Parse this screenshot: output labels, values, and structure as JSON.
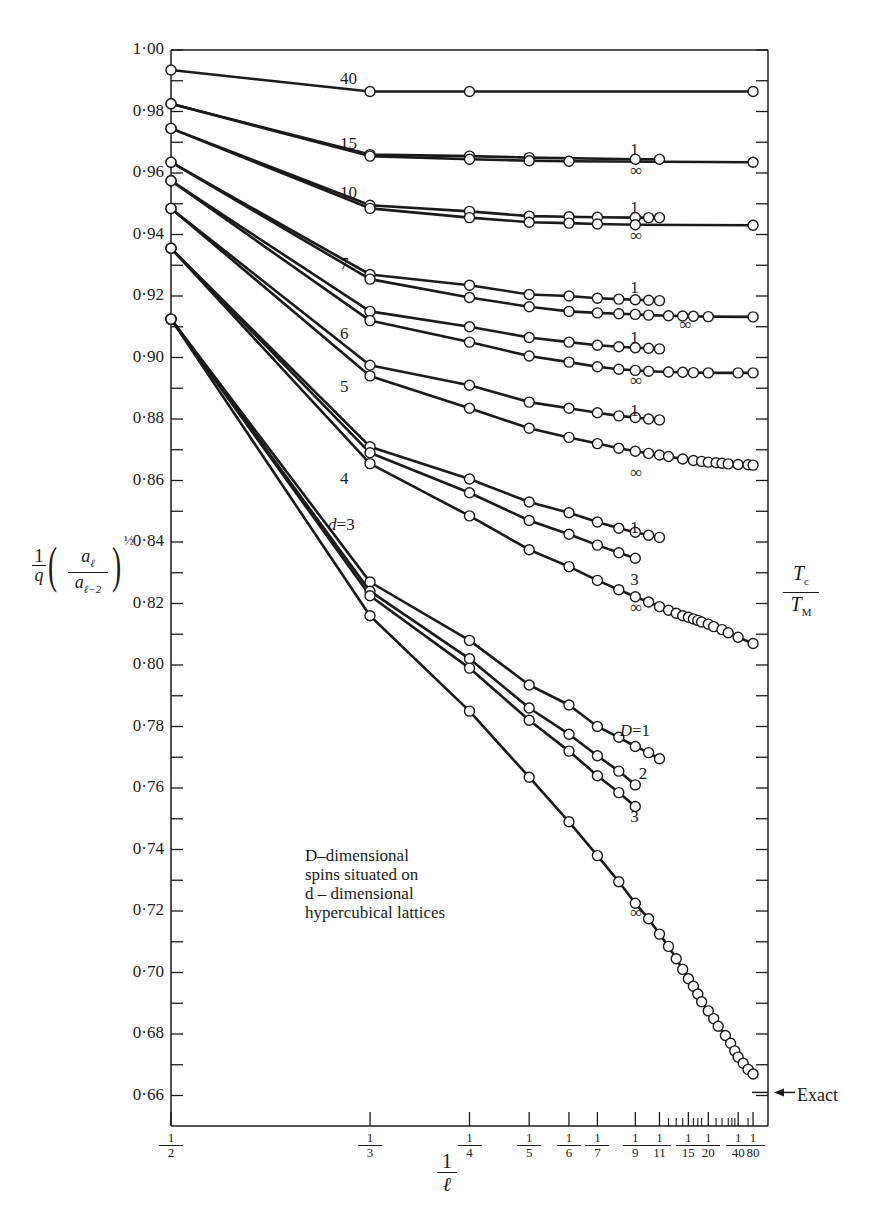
{
  "chart_data": {
    "type": "line",
    "title": "",
    "xlabel": "1/ℓ",
    "ylabel": "(1/q)(a_ℓ / a_{ℓ-2})^{1/2}",
    "right_label": "Tc / TM",
    "annotation": [
      "D-dimensional",
      "spins situated on",
      "d-dimensional",
      "hypercubical lattices"
    ],
    "exact_marker": {
      "label": "Exact",
      "y": 0.661
    },
    "ylim": [
      0.65,
      1.0
    ],
    "xlim": [
      0,
      0.5
    ],
    "x_scale": "linear in 1/ℓ (reversed: 1/2 at left, 0 at right)",
    "y_ticks": [
      "1·00",
      "0·98",
      "0·96",
      "0·94",
      "0·92",
      "0·90",
      "0·88",
      "0·86",
      "0·84",
      "0·82",
      "0·80",
      "0·78",
      "0·76",
      "0·74",
      "0·72",
      "0·70",
      "0·68",
      "0·66"
    ],
    "x_ticks": [
      {
        "num": "1",
        "den": "2",
        "value": 0.5
      },
      {
        "num": "1",
        "den": "3",
        "value": 0.3333
      },
      {
        "num": "1",
        "den": "4",
        "value": 0.25
      },
      {
        "num": "1",
        "den": "5",
        "value": 0.2
      },
      {
        "num": "1",
        "den": "6",
        "value": 0.1667
      },
      {
        "num": "1",
        "den": "7",
        "value": 0.1429
      },
      {
        "num": "1",
        "den": "9",
        "value": 0.1111
      },
      {
        "num": "1",
        "den": "11",
        "value": 0.0909
      },
      {
        "num": "1",
        "den": "15",
        "value": 0.0667
      },
      {
        "num": "1",
        "den": "20",
        "value": 0.05
      },
      {
        "num": "1",
        "den": "40",
        "value": 0.025
      },
      {
        "num": "1",
        "den": "80",
        "value": 0.0125
      }
    ],
    "minor_x_ticks": [
      0.0833,
      0.0769,
      0.0714,
      0.0625,
      0.0588,
      0.0556,
      0.0435,
      0.0385,
      0.0333,
      0.0303,
      0.0278,
      0.0167
    ],
    "group_labels": [
      {
        "text": "40",
        "x": 0.335,
        "y": 0.9905
      },
      {
        "text": "15",
        "x": 0.335,
        "y": 0.9695
      },
      {
        "text": "10",
        "x": 0.335,
        "y": 0.9535
      },
      {
        "text": "7",
        "x": 0.335,
        "y": 0.9305
      },
      {
        "text": "6",
        "x": 0.335,
        "y": 0.9075
      },
      {
        "text": "5",
        "x": 0.335,
        "y": 0.8905
      },
      {
        "text": "4",
        "x": 0.335,
        "y": 0.8605
      },
      {
        "text": "d=3",
        "x": 0.345,
        "y": 0.8455
      }
    ],
    "series_labels": [
      {
        "text": "1",
        "x": 0.1111,
        "y": 0.9675
      },
      {
        "text": "∞",
        "x": 0.1111,
        "y": 0.9605
      },
      {
        "text": "1",
        "x": 0.1111,
        "y": 0.9485
      },
      {
        "text": "∞",
        "x": 0.1111,
        "y": 0.9395
      },
      {
        "text": "1",
        "x": 0.1111,
        "y": 0.9225
      },
      {
        "text": "∞",
        "x": 0.07,
        "y": 0.9105
      },
      {
        "text": "1",
        "x": 0.1111,
        "y": 0.9065
      },
      {
        "text": "∞",
        "x": 0.1111,
        "y": 0.8925
      },
      {
        "text": "1",
        "x": 0.1111,
        "y": 0.8825
      },
      {
        "text": "∞",
        "x": 0.1111,
        "y": 0.8625
      },
      {
        "text": "1",
        "x": 0.1111,
        "y": 0.8445
      },
      {
        "text": "3",
        "x": 0.1111,
        "y": 0.8275
      },
      {
        "text": "∞",
        "x": 0.1111,
        "y": 0.8185
      },
      {
        "text": "D=1",
        "x": 0.12,
        "y": 0.7785
      },
      {
        "text": "2",
        "x": 0.104,
        "y": 0.7645
      },
      {
        "text": "3",
        "x": 0.1111,
        "y": 0.7505
      },
      {
        "text": "∞",
        "x": 0.1111,
        "y": 0.7195
      }
    ],
    "series": [
      {
        "name": "d=40, D=1",
        "x": [
          0.5,
          0.3333,
          0.25,
          0.0125
        ],
        "y": [
          0.9935,
          0.9865,
          0.9865,
          0.9865
        ]
      },
      {
        "name": "d=15, D=1",
        "x": [
          0.5,
          0.3333,
          0.25,
          0.2,
          0.1111,
          0.0909
        ],
        "y": [
          0.9825,
          0.966,
          0.9655,
          0.965,
          0.9645,
          0.9645
        ]
      },
      {
        "name": "d=15, D=∞",
        "x": [
          0.5,
          0.3333,
          0.25,
          0.2,
          0.1667,
          0.0125
        ],
        "y": [
          0.9825,
          0.9655,
          0.9645,
          0.964,
          0.9638,
          0.9635
        ]
      },
      {
        "name": "d=10, D=1",
        "x": [
          0.5,
          0.3333,
          0.25,
          0.2,
          0.1667,
          0.1429,
          0.1111,
          0.1,
          0.0909
        ],
        "y": [
          0.9745,
          0.9495,
          0.9475,
          0.946,
          0.9458,
          0.9456,
          0.9455,
          0.9455,
          0.9455
        ]
      },
      {
        "name": "d=10, D=∞",
        "x": [
          0.5,
          0.3333,
          0.25,
          0.2,
          0.1667,
          0.1429,
          0.1111,
          0.0125
        ],
        "y": [
          0.9745,
          0.9485,
          0.9455,
          0.944,
          0.9437,
          0.9434,
          0.9432,
          0.943
        ]
      },
      {
        "name": "d=7, D=1",
        "x": [
          0.5,
          0.3333,
          0.25,
          0.2,
          0.1667,
          0.1429,
          0.125,
          0.1111,
          0.1,
          0.0909
        ],
        "y": [
          0.9635,
          0.927,
          0.9235,
          0.9205,
          0.92,
          0.9193,
          0.919,
          0.9188,
          0.9186,
          0.9185
        ]
      },
      {
        "name": "d=7, D=∞",
        "x": [
          0.5,
          0.3333,
          0.25,
          0.2,
          0.1667,
          0.1429,
          0.125,
          0.1111,
          0.1,
          0.0833,
          0.0714,
          0.0625,
          0.05,
          0.0125
        ],
        "y": [
          0.9635,
          0.9255,
          0.9195,
          0.9165,
          0.915,
          0.9145,
          0.9142,
          0.914,
          0.9138,
          0.9136,
          0.9135,
          0.9134,
          0.9133,
          0.9132
        ]
      },
      {
        "name": "d=6, D=1",
        "x": [
          0.5,
          0.3333,
          0.25,
          0.2,
          0.1667,
          0.1429,
          0.125,
          0.1111,
          0.1,
          0.0909
        ],
        "y": [
          0.9575,
          0.915,
          0.91,
          0.9065,
          0.905,
          0.904,
          0.9035,
          0.9032,
          0.903,
          0.9028
        ]
      },
      {
        "name": "d=6, D=∞",
        "x": [
          0.5,
          0.3333,
          0.25,
          0.2,
          0.1667,
          0.1429,
          0.125,
          0.1111,
          0.1,
          0.0833,
          0.0714,
          0.0625,
          0.05,
          0.025,
          0.0125
        ],
        "y": [
          0.9575,
          0.912,
          0.905,
          0.9005,
          0.8985,
          0.897,
          0.8962,
          0.8958,
          0.8955,
          0.8953,
          0.8952,
          0.8951,
          0.895,
          0.895,
          0.895
        ]
      },
      {
        "name": "d=5, D=1",
        "x": [
          0.5,
          0.3333,
          0.25,
          0.2,
          0.1667,
          0.1429,
          0.125,
          0.1111,
          0.1,
          0.0909
        ],
        "y": [
          0.9485,
          0.8975,
          0.891,
          0.8855,
          0.8835,
          0.882,
          0.881,
          0.8805,
          0.88,
          0.8797
        ]
      },
      {
        "name": "d=5, D=∞",
        "x": [
          0.5,
          0.3333,
          0.25,
          0.2,
          0.1667,
          0.1429,
          0.125,
          0.1111,
          0.1,
          0.0909,
          0.0833,
          0.0714,
          0.0625,
          0.0556,
          0.05,
          0.0435,
          0.0385,
          0.0333,
          0.025,
          0.0167,
          0.0125
        ],
        "y": [
          0.9485,
          0.894,
          0.8835,
          0.877,
          0.874,
          0.872,
          0.8705,
          0.8695,
          0.8688,
          0.8683,
          0.8678,
          0.867,
          0.8665,
          0.8662,
          0.866,
          0.8658,
          0.8656,
          0.8654,
          0.8652,
          0.8651,
          0.865
        ]
      },
      {
        "name": "d=4, D=1",
        "x": [
          0.5,
          0.3333,
          0.25,
          0.2,
          0.1667,
          0.1429,
          0.125,
          0.1111,
          0.1,
          0.0909
        ],
        "y": [
          0.9355,
          0.871,
          0.8605,
          0.853,
          0.8495,
          0.8465,
          0.8445,
          0.8432,
          0.8422,
          0.8415
        ]
      },
      {
        "name": "d=4, D=3",
        "x": [
          0.5,
          0.3333,
          0.25,
          0.2,
          0.1667,
          0.1429,
          0.125,
          0.1111
        ],
        "y": [
          0.9355,
          0.869,
          0.856,
          0.847,
          0.8425,
          0.839,
          0.8365,
          0.8347
        ]
      },
      {
        "name": "d=4, D=∞",
        "x": [
          0.5,
          0.3333,
          0.25,
          0.2,
          0.1667,
          0.1429,
          0.125,
          0.1111,
          0.1,
          0.0909,
          0.0833,
          0.0769,
          0.0714,
          0.0667,
          0.0625,
          0.0588,
          0.0556,
          0.05,
          0.0455,
          0.0385,
          0.0333,
          0.025,
          0.0125
        ],
        "y": [
          0.9355,
          0.8655,
          0.8485,
          0.8375,
          0.832,
          0.8275,
          0.8245,
          0.8222,
          0.8205,
          0.819,
          0.8178,
          0.8168,
          0.816,
          0.8155,
          0.815,
          0.8145,
          0.814,
          0.8133,
          0.8125,
          0.8115,
          0.8105,
          0.809,
          0.807
        ]
      },
      {
        "name": "d=3, D=1",
        "x": [
          0.5,
          0.3333,
          0.25,
          0.2,
          0.1667,
          0.1429,
          0.125,
          0.1111,
          0.1,
          0.0909
        ],
        "y": [
          0.9125,
          0.827,
          0.808,
          0.7935,
          0.787,
          0.78,
          0.7765,
          0.7735,
          0.7715,
          0.7695
        ]
      },
      {
        "name": "d=3, D=2",
        "x": [
          0.5,
          0.3333,
          0.25,
          0.2,
          0.1667,
          0.1429,
          0.125,
          0.1111
        ],
        "y": [
          0.9125,
          0.824,
          0.802,
          0.786,
          0.7775,
          0.7705,
          0.7655,
          0.761
        ]
      },
      {
        "name": "d=3, D=3",
        "x": [
          0.5,
          0.3333,
          0.25,
          0.2,
          0.1667,
          0.1429,
          0.125,
          0.1111
        ],
        "y": [
          0.9125,
          0.8225,
          0.799,
          0.782,
          0.772,
          0.764,
          0.7585,
          0.754
        ]
      },
      {
        "name": "d=3, D=∞",
        "x": [
          0.5,
          0.3333,
          0.25,
          0.2,
          0.1667,
          0.1429,
          0.125,
          0.1111,
          0.1,
          0.0909,
          0.0833,
          0.0769,
          0.0714,
          0.0667,
          0.0625,
          0.0588,
          0.0556,
          0.05,
          0.0455,
          0.0417,
          0.0357,
          0.0313,
          0.0278,
          0.025,
          0.0208,
          0.0167,
          0.0125
        ],
        "y": [
          0.9125,
          0.816,
          0.785,
          0.7635,
          0.749,
          0.738,
          0.7295,
          0.7225,
          0.7175,
          0.7125,
          0.7085,
          0.7045,
          0.701,
          0.698,
          0.6955,
          0.693,
          0.6905,
          0.6875,
          0.685,
          0.6825,
          0.6795,
          0.677,
          0.6745,
          0.6725,
          0.6705,
          0.6685,
          0.667
        ]
      }
    ]
  },
  "labels": {
    "exact": "Exact",
    "annotation_line1": "D–dimensional",
    "annotation_line2": "spins situated on",
    "annotation_line3": "d – dimensional",
    "annotation_line4": "hypercubical lattices",
    "xaxis_num": "1",
    "xaxis_den": "ℓ",
    "right_num": "T",
    "right_num_sub": "c",
    "right_den": "T",
    "right_den_sub": "M",
    "ylabel_one": "1",
    "ylabel_q": "q",
    "ylabel_num": "a",
    "ylabel_num_sub": "ℓ",
    "ylabel_den": "a",
    "ylabel_den_sub": "ℓ−2",
    "ylabel_exp": "½"
  }
}
